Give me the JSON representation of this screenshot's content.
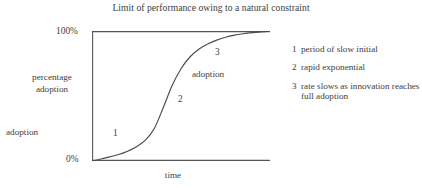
{
  "chart_data": {
    "type": "line",
    "title": "Limit of performance owing to a natural constraint",
    "xlabel": "time",
    "ylabel": "percentage\nadoption",
    "ylabel_secondary": "adoption",
    "ytick_labels": [
      "100%",
      "0%"
    ],
    "ylim": [
      0,
      100
    ],
    "xlim": [
      0,
      1
    ],
    "grid": false,
    "legend_position": "right",
    "series": [
      {
        "name": "adoption S-curve",
        "x": [
          0.0,
          0.05,
          0.1,
          0.15,
          0.2,
          0.25,
          0.3,
          0.35,
          0.4,
          0.45,
          0.5,
          0.55,
          0.6,
          0.65,
          0.7,
          0.75,
          0.8,
          0.85,
          0.9,
          0.95,
          1.0
        ],
        "y": [
          0.0,
          1.5,
          3.2,
          5.0,
          7.5,
          11.0,
          16.0,
          25.0,
          41.0,
          58.0,
          71.0,
          80.0,
          86.0,
          90.0,
          93.0,
          95.2,
          96.8,
          97.9,
          98.7,
          99.3,
          99.8
        ]
      }
    ],
    "reference_lines": [
      {
        "name": "limit-line",
        "orientation": "horizontal",
        "value": 100,
        "label": "100%"
      }
    ],
    "annotations": [
      {
        "key": "1",
        "text": "1",
        "x_frac": 0.13,
        "y_frac": 0.24
      },
      {
        "key": "2",
        "text": "2",
        "x_frac": 0.49,
        "y_frac": 0.51
      },
      {
        "key": "3",
        "text": "3",
        "x_frac": 0.7,
        "y_frac": 0.87
      },
      {
        "key": "adoption",
        "text": "adoption",
        "x_frac": 0.58,
        "y_frac": 0.72
      }
    ],
    "legend": [
      {
        "key": "1",
        "text": "period of slow initial"
      },
      {
        "key": "2",
        "text": "rapid exponential"
      },
      {
        "key": "3",
        "text": "rate slows as innovation reaches full adoption"
      }
    ],
    "colors": {
      "background": "#ffffff",
      "line": "#4a4a4a",
      "axis": "#555555",
      "text": "#3d3d3d"
    }
  }
}
